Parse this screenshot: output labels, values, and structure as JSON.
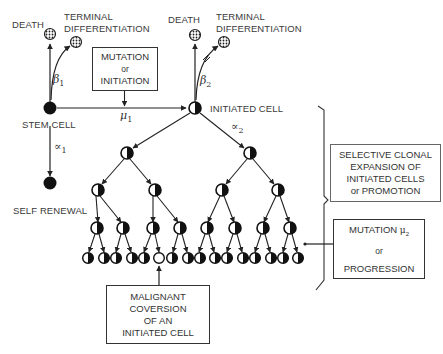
{
  "stem_cell": {
    "label": "STEM CELL",
    "death_label": "DEATH",
    "terminal_diff_label_1": "TERMINAL",
    "terminal_diff_label_2": "DIFFERENTIATION",
    "beta": "β",
    "beta_sub": "1",
    "alpha": "∝",
    "alpha_sub": "1",
    "self_renewal_label": "SELF RENEWAL"
  },
  "mutation_box": {
    "line1": "MUTATION",
    "line2": "or",
    "line3": "INITIATION"
  },
  "mu1": {
    "symbol": "μ",
    "sub": "1"
  },
  "initiated_cell": {
    "label": "INITIATED CELL",
    "death_label": "DEATH",
    "terminal_diff_label_1": "TERMINAL",
    "terminal_diff_label_2": "DIFFERENTIATION",
    "beta": "β",
    "beta_sub": "2",
    "alpha": "∝",
    "alpha_sub": "2"
  },
  "promotion_box": {
    "line1": "SELECTIVE CLONAL",
    "line2": "EXPANSION OF",
    "line3": "INITIATED CELLS",
    "line4": "or PROMOTION"
  },
  "progression_box": {
    "line1": "MUTATION",
    "mu_symbol": "μ",
    "mu_sub": "2",
    "line2": "or",
    "line3": "PROGRESSION"
  },
  "malignant_box": {
    "line1": "MALIGNANT",
    "line2": "COVERSION",
    "line3": "OF AN",
    "line4": "INITIATED CELL"
  },
  "tree": {
    "levels": 4,
    "leaf_count": 16,
    "malignant_leaf_index": 5
  }
}
